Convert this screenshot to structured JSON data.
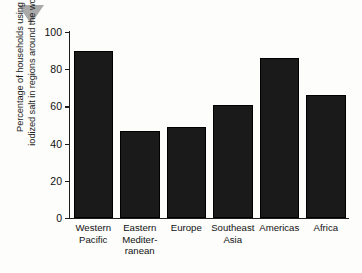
{
  "marker": {
    "icon": "triangle-down-marker",
    "color": "#a9a9a9"
  },
  "chart_data": {
    "type": "bar",
    "title": "",
    "xlabel": "",
    "ylabel": "Percentage of households using iodized salt in regions around the world",
    "ylabel_lines": [
      "Percentage of households using",
      "iodized salt in regions around the world"
    ],
    "categories": [
      "Western Pacific",
      "Eastern Mediterranean",
      "Europe",
      "Southeast Asia",
      "Americas",
      "Africa"
    ],
    "category_label_lines": [
      [
        "Western",
        "Pacific"
      ],
      [
        "Eastern",
        "Mediter-",
        "ranean"
      ],
      [
        "Europe"
      ],
      [
        "Southeast",
        "Asia"
      ],
      [
        "Americas"
      ],
      [
        "Africa"
      ]
    ],
    "values": [
      90,
      47,
      49,
      61,
      86,
      66
    ],
    "ylim": [
      0,
      100
    ],
    "yticks": [
      0,
      20,
      40,
      60,
      80,
      100
    ],
    "ytick_labels": [
      "0",
      "20",
      "40",
      "60",
      "80",
      "100"
    ],
    "grid": false,
    "legend": false,
    "bar_color": "#1a1a1a",
    "background_color": "#fdfdfb",
    "axis_color": "#1d1d1d"
  }
}
